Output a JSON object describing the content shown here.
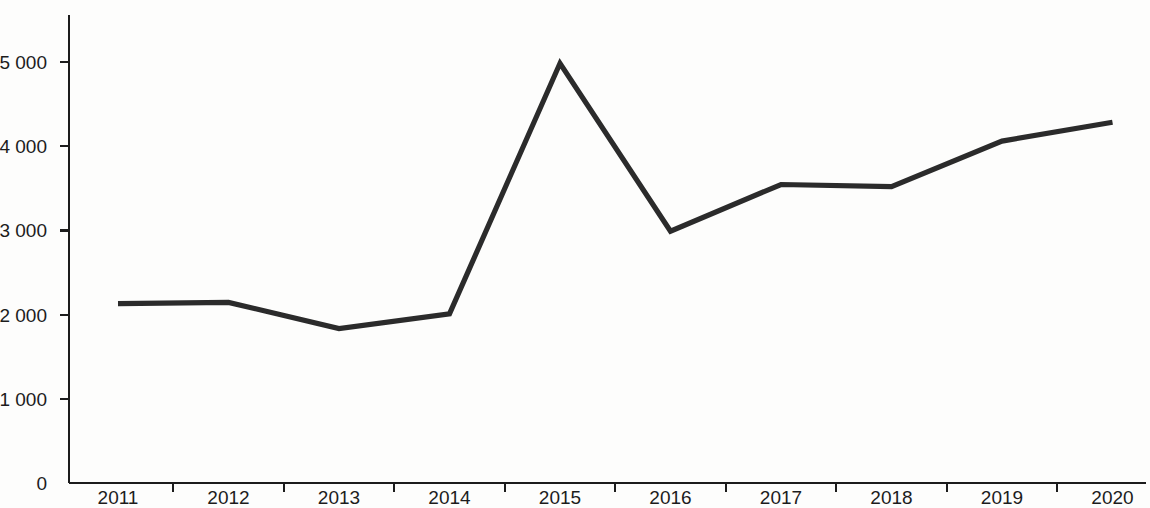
{
  "chart_data": {
    "type": "line",
    "title": "",
    "subtitle": "",
    "xlabel": "",
    "ylabel": "",
    "categories": [
      "2011",
      "2012",
      "2013",
      "2014",
      "2015",
      "2016",
      "2017",
      "2018",
      "2019",
      "2020"
    ],
    "values": [
      2130,
      2145,
      1835,
      2010,
      4985,
      2990,
      3545,
      3520,
      4060,
      4285
    ],
    "series": [
      {
        "name": "",
        "values": [
          2130,
          2145,
          1835,
          2010,
          4985,
          2990,
          3545,
          3520,
          4060,
          4285
        ]
      }
    ],
    "ylim": [
      0,
      5400
    ],
    "y_ticks": [
      0,
      1000,
      2000,
      3000,
      4000,
      5000
    ],
    "y_tick_labels": [
      "0",
      "1 000",
      "2 000",
      "3 000",
      "4 000",
      "5 000"
    ],
    "x_tick_labels": [
      "2011",
      "2012",
      "2013",
      "2014",
      "2015",
      "2016",
      "2017",
      "2018",
      "2019",
      "2020"
    ],
    "grid": false,
    "legend": null,
    "legend_position": "none",
    "annotations": [],
    "line_color": "#2b2b2b",
    "axis_color": "#1c1c1c",
    "background_color": "#fdfdfc"
  },
  "axes": {
    "y_axis_name": "value-axis",
    "x_axis_name": "year-axis"
  }
}
